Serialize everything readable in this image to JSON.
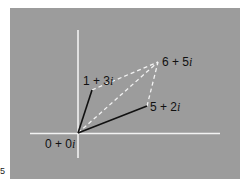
{
  "diagram": {
    "type": "complex-plane-vector-addition",
    "background_color": "#9c9c9c",
    "axis_color": "#f2f2f2",
    "solid_vector_color": "#111111",
    "dashed_line_color": "#f2f2f2",
    "points": [
      {
        "id": "origin",
        "label": "0 + 0i",
        "re": 0,
        "im": 0
      },
      {
        "id": "z1",
        "label": "1 + 3i",
        "re": 1,
        "im": 3
      },
      {
        "id": "z2",
        "label": "5 + 2i",
        "re": 5,
        "im": 2
      },
      {
        "id": "sum",
        "label": "6 + 5i",
        "re": 6,
        "im": 5
      }
    ],
    "solid_vectors": [
      {
        "from": "origin",
        "to": "z1"
      },
      {
        "from": "origin",
        "to": "z2"
      }
    ],
    "dashed_lines": [
      {
        "from": "z1",
        "to": "sum"
      },
      {
        "from": "z2",
        "to": "sum"
      },
      {
        "from": "origin",
        "to": "sum"
      }
    ]
  },
  "labels": {
    "origin": "0 + 0",
    "z1": "1 + 3",
    "z2": "5 + 2",
    "sum": "6 + 5",
    "imag_unit": "i"
  },
  "edge_mark": "5"
}
